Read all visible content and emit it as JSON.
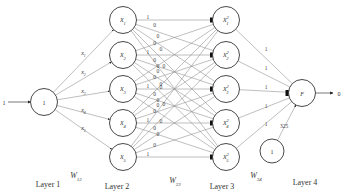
{
  "input_value": "1",
  "output_value": "0",
  "layer1": {
    "node_label": "1",
    "edge_labels": [
      "x",
      "x",
      "x",
      "x",
      "x"
    ],
    "edge_subs": [
      "1",
      "2",
      "3",
      "4",
      "5"
    ]
  },
  "layer2": {
    "nodes": [
      {
        "base": "x",
        "sub": "1"
      },
      {
        "base": "x",
        "sub": "2"
      },
      {
        "base": "x",
        "sub": "3"
      },
      {
        "base": "x",
        "sub": "4"
      },
      {
        "base": "x",
        "sub": "5"
      }
    ]
  },
  "layer3": {
    "nodes": [
      {
        "base": "x",
        "sup": "2",
        "sub": "1"
      },
      {
        "base": "x",
        "sup": "2",
        "sub": "2"
      },
      {
        "base": "x",
        "sup": "2",
        "sub": "3"
      },
      {
        "base": "x",
        "sup": "2",
        "sub": "4"
      },
      {
        "base": "x",
        "sup": "2",
        "sub": "5"
      }
    ]
  },
  "w23_labels": {
    "diagonal": "1",
    "off": "0"
  },
  "layer4": {
    "node_label": "F",
    "edge_labels": [
      "1",
      "1",
      "1",
      "1",
      "1"
    ],
    "bias_label": "1",
    "bias_weight": "325"
  },
  "weights": {
    "w12": {
      "base": "W",
      "sub": "12"
    },
    "w23": {
      "base": "W",
      "sub": "23"
    },
    "w34": {
      "base": "W",
      "sub": "34"
    }
  },
  "layer_titles": [
    "Layer 1",
    "Layer 2",
    "Layer 3",
    "Layer 4"
  ]
}
